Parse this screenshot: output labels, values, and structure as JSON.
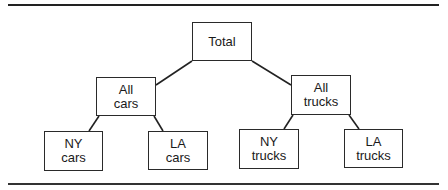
{
  "diagram": {
    "type": "tree",
    "nodes": [
      {
        "id": "total",
        "lines": [
          "Total"
        ],
        "x": 192,
        "y": 22,
        "w": 60,
        "h": 39
      },
      {
        "id": "all-cars",
        "lines": [
          "All",
          "cars"
        ],
        "x": 96,
        "y": 77,
        "w": 60,
        "h": 39
      },
      {
        "id": "all-trucks",
        "lines": [
          "All",
          "trucks"
        ],
        "x": 291,
        "y": 75,
        "w": 60,
        "h": 40
      },
      {
        "id": "ny-cars",
        "lines": [
          "NY",
          "cars"
        ],
        "x": 44,
        "y": 131,
        "w": 59,
        "h": 40
      },
      {
        "id": "la-cars",
        "lines": [
          "LA",
          "cars"
        ],
        "x": 148,
        "y": 131,
        "w": 60,
        "h": 39
      },
      {
        "id": "ny-trucks",
        "lines": [
          "NY",
          "trucks"
        ],
        "x": 239,
        "y": 129,
        "w": 60,
        "h": 40
      },
      {
        "id": "la-trucks",
        "lines": [
          "LA",
          "trucks"
        ],
        "x": 344,
        "y": 129,
        "w": 59,
        "h": 39
      }
    ],
    "edges": [
      {
        "from": "total",
        "to": "all-cars",
        "x1": 192,
        "y1": 61,
        "x2": 156,
        "y2": 85
      },
      {
        "from": "total",
        "to": "all-trucks",
        "x1": 252,
        "y1": 61,
        "x2": 291,
        "y2": 85
      },
      {
        "from": "all-cars",
        "to": "ny-cars",
        "x1": 99,
        "y1": 116,
        "x2": 89,
        "y2": 131
      },
      {
        "from": "all-cars",
        "to": "la-cars",
        "x1": 154,
        "y1": 116,
        "x2": 163,
        "y2": 131
      },
      {
        "from": "all-trucks",
        "to": "ny-trucks",
        "x1": 293,
        "y1": 115,
        "x2": 284,
        "y2": 129
      },
      {
        "from": "all-trucks",
        "to": "la-trucks",
        "x1": 349,
        "y1": 115,
        "x2": 359,
        "y2": 129
      }
    ]
  }
}
